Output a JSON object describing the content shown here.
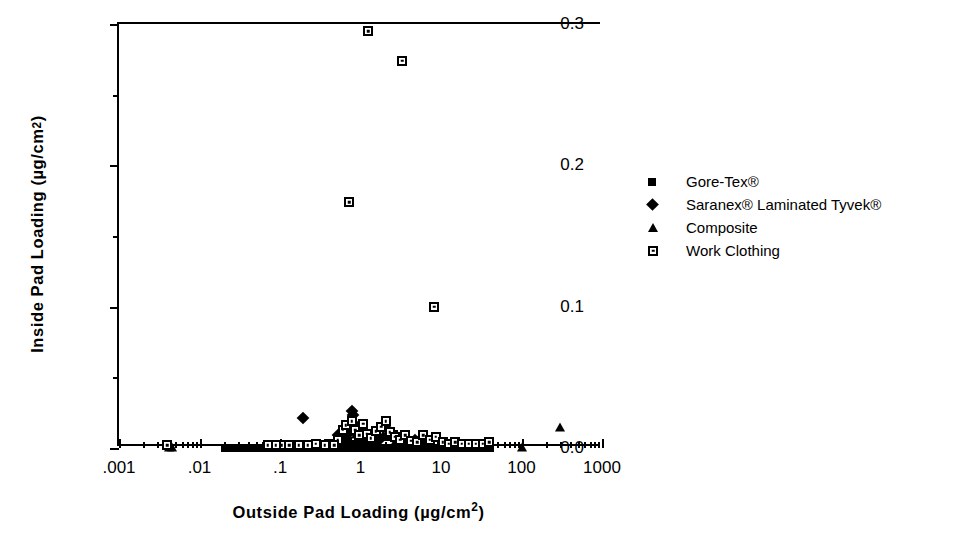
{
  "chart_data": {
    "type": "scatter",
    "title": "",
    "xlabel": "Outside Pad Loading (µg/cm²)",
    "ylabel": "Inside Pad Loading (µg/cm²)",
    "xscale": "log",
    "yscale": "linear",
    "xlim": [
      0.001,
      1000
    ],
    "ylim": [
      0.0,
      0.3
    ],
    "grid": false,
    "legend_position": "right",
    "x_ticks": [
      {
        "value": 0.001,
        "label": ".001"
      },
      {
        "value": 0.01,
        "label": ".01"
      },
      {
        "value": 0.1,
        "label": ".1"
      },
      {
        "value": 1,
        "label": "1"
      },
      {
        "value": 10,
        "label": "10"
      },
      {
        "value": 100,
        "label": "100"
      },
      {
        "value": 1000,
        "label": "1000"
      }
    ],
    "y_ticks": [
      {
        "value": 0.0,
        "label": "0.0"
      },
      {
        "value": 0.05,
        "label": ""
      },
      {
        "value": 0.1,
        "label": "0.1"
      },
      {
        "value": 0.15,
        "label": ""
      },
      {
        "value": 0.2,
        "label": "0.2"
      },
      {
        "value": 0.25,
        "label": ""
      },
      {
        "value": 0.3,
        "label": "0.3"
      }
    ],
    "series": [
      {
        "name": "Gore-Tex®",
        "marker": "filled-square",
        "points": [
          [
            0.021,
            0.0
          ],
          [
            0.024,
            0.0
          ],
          [
            0.027,
            0.0
          ],
          [
            0.03,
            0.0
          ],
          [
            0.034,
            0.0
          ],
          [
            0.038,
            0.0
          ],
          [
            0.043,
            0.0
          ],
          [
            0.048,
            0.0
          ],
          [
            0.054,
            0.0
          ],
          [
            0.061,
            0.0
          ],
          [
            0.069,
            0.0
          ],
          [
            0.078,
            0.0
          ],
          [
            0.088,
            0.0
          ],
          [
            0.099,
            0.0
          ],
          [
            0.112,
            0.0
          ],
          [
            0.126,
            0.0
          ],
          [
            0.142,
            0.0
          ],
          [
            0.16,
            0.0
          ],
          [
            0.181,
            0.0
          ],
          [
            0.204,
            0.0
          ],
          [
            0.23,
            0.0
          ],
          [
            0.26,
            0.0
          ],
          [
            0.293,
            0.0
          ],
          [
            0.33,
            0.0
          ],
          [
            0.372,
            0.0
          ],
          [
            0.42,
            0.0
          ],
          [
            0.474,
            0.0
          ],
          [
            0.535,
            0.0
          ],
          [
            0.603,
            0.0
          ],
          [
            0.68,
            0.0
          ],
          [
            0.767,
            0.0
          ],
          [
            0.865,
            0.0
          ],
          [
            0.976,
            0.0
          ],
          [
            1.1,
            0.0
          ],
          [
            1.24,
            0.0
          ],
          [
            1.4,
            0.0
          ],
          [
            1.58,
            0.0
          ],
          [
            1.78,
            0.0
          ],
          [
            2.01,
            0.0
          ],
          [
            2.27,
            0.0
          ],
          [
            2.56,
            0.0
          ],
          [
            2.89,
            0.0
          ],
          [
            3.26,
            0.0
          ],
          [
            3.68,
            0.0
          ],
          [
            4.15,
            0.0
          ],
          [
            4.68,
            0.0
          ],
          [
            5.28,
            0.0
          ],
          [
            5.96,
            0.0
          ],
          [
            6.72,
            0.0
          ],
          [
            7.58,
            0.0
          ],
          [
            8.55,
            0.0
          ],
          [
            9.65,
            0.0
          ],
          [
            10.9,
            0.0
          ],
          [
            12.3,
            0.0
          ],
          [
            13.9,
            0.0
          ],
          [
            15.6,
            0.0
          ],
          [
            17.7,
            0.0
          ],
          [
            19.9,
            0.0
          ],
          [
            22.5,
            0.0
          ],
          [
            25.4,
            0.0
          ],
          [
            28.6,
            0.0
          ],
          [
            32.3,
            0.0
          ],
          [
            36.4,
            0.0
          ],
          [
            41.1,
            0.0
          ],
          [
            0.56,
            0.004
          ],
          [
            0.62,
            0.004
          ],
          [
            0.7,
            0.005
          ],
          [
            0.79,
            0.003
          ],
          [
            0.92,
            0.006
          ],
          [
            1.05,
            0.004
          ],
          [
            1.2,
            0.003
          ],
          [
            1.35,
            0.005
          ],
          [
            1.55,
            0.004
          ],
          [
            2.1,
            0.008
          ],
          [
            2.35,
            0.012
          ],
          [
            2.6,
            0.01
          ],
          [
            3.0,
            0.007
          ],
          [
            3.4,
            0.005
          ],
          [
            5.2,
            0.006
          ],
          [
            6.1,
            0.004
          ],
          [
            7.0,
            0.003
          ],
          [
            0.46,
            0.003
          ],
          [
            0.38,
            0.002
          ],
          [
            0.3,
            0.002
          ]
        ]
      },
      {
        "name": " Saranex® Laminated Tyvek®",
        "marker": "filled-diamond",
        "points": [
          [
            0.195,
            0.021
          ],
          [
            0.78,
            0.026
          ],
          [
            0.8,
            0.023
          ],
          [
            0.62,
            0.013
          ],
          [
            0.7,
            0.01
          ],
          [
            0.86,
            0.016
          ],
          [
            0.95,
            0.012
          ],
          [
            1.05,
            0.009
          ],
          [
            1.2,
            0.008
          ],
          [
            1.45,
            0.007
          ],
          [
            1.7,
            0.006
          ],
          [
            2.2,
            0.013
          ],
          [
            2.45,
            0.009
          ],
          [
            3.1,
            0.007
          ],
          [
            4.0,
            0.005
          ],
          [
            4.8,
            0.006
          ],
          [
            0.52,
            0.009
          ],
          [
            0.58,
            0.007
          ],
          [
            0.66,
            0.005
          ]
        ]
      },
      {
        "name": "Composite",
        "marker": "filled-triangle",
        "points": [
          [
            0.0042,
            0.001
          ],
          [
            0.0045,
            0.001
          ],
          [
            300,
            0.015
          ],
          [
            100,
            0.001
          ],
          [
            0.72,
            0.012
          ],
          [
            0.88,
            0.01
          ],
          [
            1.1,
            0.008
          ],
          [
            1.9,
            0.009
          ],
          [
            2.8,
            0.006
          ]
        ]
      },
      {
        "name": "Work Clothing",
        "marker": "open-square-dot",
        "points": [
          [
            1.25,
            0.295
          ],
          [
            3.3,
            0.274
          ],
          [
            0.72,
            0.174
          ],
          [
            8.3,
            0.1
          ],
          [
            0.004,
            0.002
          ],
          [
            0.105,
            0.002
          ],
          [
            0.41,
            0.003
          ],
          [
            0.52,
            0.006
          ],
          [
            0.6,
            0.013
          ],
          [
            0.66,
            0.016
          ],
          [
            0.78,
            0.019
          ],
          [
            0.86,
            0.013
          ],
          [
            0.97,
            0.009
          ],
          [
            1.08,
            0.017
          ],
          [
            1.2,
            0.01
          ],
          [
            1.35,
            0.007
          ],
          [
            1.55,
            0.012
          ],
          [
            1.8,
            0.015
          ],
          [
            2.05,
            0.019
          ],
          [
            2.3,
            0.011
          ],
          [
            2.7,
            0.008
          ],
          [
            3.1,
            0.006
          ],
          [
            3.6,
            0.009
          ],
          [
            4.3,
            0.005
          ],
          [
            5.1,
            0.004
          ],
          [
            6.0,
            0.009
          ],
          [
            7.2,
            0.006
          ],
          [
            8.6,
            0.008
          ],
          [
            10.5,
            0.004
          ],
          [
            12.5,
            0.003
          ],
          [
            15.0,
            0.004
          ],
          [
            18.0,
            0.003
          ],
          [
            22.0,
            0.003
          ],
          [
            27.0,
            0.003
          ],
          [
            33.0,
            0.003
          ],
          [
            40.0,
            0.004
          ],
          [
            0.47,
            0.002
          ],
          [
            0.36,
            0.002
          ],
          [
            0.28,
            0.003
          ],
          [
            0.22,
            0.002
          ],
          [
            0.17,
            0.002
          ],
          [
            0.13,
            0.002
          ],
          [
            0.088,
            0.002
          ],
          [
            0.07,
            0.002
          ]
        ]
      }
    ]
  },
  "legend": {
    "entries": [
      {
        "label": "Gore-Tex®",
        "marker": "filled-square"
      },
      {
        "label": " Saranex® Laminated Tyvek®",
        "marker": "filled-diamond"
      },
      {
        "label": "Composite",
        "marker": "filled-triangle"
      },
      {
        "label": "Work Clothing",
        "marker": "open-square-dot"
      }
    ]
  },
  "axes": {
    "x_title_main": "Outside Pad Loading (µg/cm",
    "x_title_sup": "2",
    "x_title_tail": ")",
    "y_title_main": "Inside Pad Loading (µg/cm",
    "y_title_sup": "2",
    "y_title_tail": ")"
  },
  "colors": {
    "ink": "#000000",
    "background": "#ffffff"
  }
}
